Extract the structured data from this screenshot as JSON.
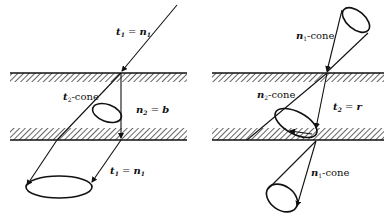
{
  "figure": {
    "colors": {
      "ink": "#111111",
      "background": "#ffffff"
    },
    "left_panel": {
      "labels": {
        "incident": {
          "main": "t",
          "sub": "1",
          "eq": " = ",
          "rhs": "n",
          "rhs_sub": "1"
        },
        "cone": {
          "main": "t",
          "sub": "2",
          "rest": "-cone"
        },
        "normal": {
          "main": "n",
          "sub": "2",
          "eq": " = ",
          "rhs": "b"
        },
        "transmitted": {
          "main": "t",
          "sub": "1",
          "eq": " = ",
          "rhs": "n",
          "rhs_sub": "1"
        }
      }
    },
    "right_panel": {
      "labels": {
        "upper_cone": {
          "main": "n",
          "sub": "1",
          "rest": "-cone"
        },
        "middle_cone": {
          "main": "n",
          "sub": "2",
          "rest": "-cone"
        },
        "tangent": {
          "main": "t",
          "sub": "2",
          "eq": " = ",
          "rhs": "r"
        },
        "lower_cone": {
          "main": "n",
          "sub": "1",
          "rest": "-cone"
        }
      }
    }
  }
}
